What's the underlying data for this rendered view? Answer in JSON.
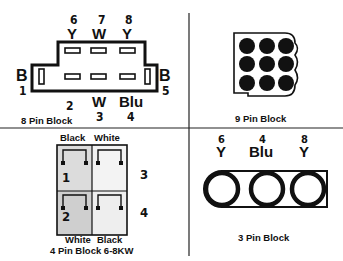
{
  "colors": {
    "ink": "#111111",
    "background": "#ffffff",
    "shade": "#d8d8d8"
  },
  "panels": {
    "eight_pin": {
      "caption": "8 Pin Block",
      "top_pins": [
        {
          "num": "6",
          "color": "Y"
        },
        {
          "num": "7",
          "color": "W"
        },
        {
          "num": "8",
          "color": "Y"
        }
      ],
      "left_pin": {
        "num": "1",
        "color": "B"
      },
      "right_pin": {
        "num": "5",
        "color": "B"
      },
      "bottom_pins": [
        {
          "num": "2",
          "color": ""
        },
        {
          "num": "3",
          "color": "W"
        },
        {
          "num": "4",
          "color": "Blu"
        }
      ]
    },
    "nine_pin": {
      "caption": "9 Pin Block",
      "rows": 3,
      "cols": 3
    },
    "four_pin": {
      "caption": "4 Pin Block 6-8KW",
      "top_labels": [
        "Black",
        "White"
      ],
      "bottom_labels": [
        "White",
        "Black"
      ],
      "pin_numbers": [
        "1",
        "2",
        "3",
        "4"
      ]
    },
    "three_pin": {
      "caption": "3 Pin Block",
      "pins": [
        {
          "num": "6",
          "color": "Y"
        },
        {
          "num": "4",
          "color": "Blu"
        },
        {
          "num": "8",
          "color": "Y"
        }
      ]
    }
  }
}
